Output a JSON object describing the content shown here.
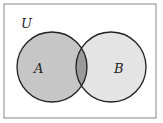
{
  "diagram": {
    "type": "venn",
    "universe_label": "U",
    "sets": [
      {
        "label": "A",
        "fill": "#c6c6c6"
      },
      {
        "label": "B",
        "fill": "#e4e4e4"
      }
    ],
    "intersection_fill": "#9a9a9a",
    "border_color": "#222222",
    "frame_color": "#888888"
  }
}
